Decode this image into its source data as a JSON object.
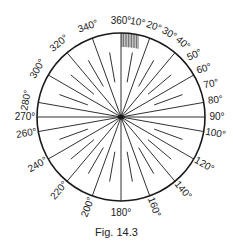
{
  "figure": {
    "caption": "Fig. 14.3",
    "center": [
      121,
      117
    ],
    "radius": 84,
    "stroke_color": "#1a1a1a",
    "hatch_color": "#555555",
    "hatched_sector": {
      "from_deg": 0,
      "to_deg": 12
    },
    "long_lines_deg": [
      0,
      20,
      40,
      60,
      80,
      90,
      100,
      120,
      140,
      160,
      180,
      200,
      220,
      240,
      260,
      270,
      280,
      300,
      320,
      340
    ],
    "short_lines_deg": [
      10,
      30,
      50,
      70,
      110,
      130,
      150,
      170,
      190,
      210,
      230,
      250,
      290,
      310,
      330,
      350
    ],
    "labels": [
      {
        "deg": 0,
        "text": "360°"
      },
      {
        "deg": 10,
        "text": "10°"
      },
      {
        "deg": 20,
        "text": "20°"
      },
      {
        "deg": 30,
        "text": "30°"
      },
      {
        "deg": 40,
        "text": "40°"
      },
      {
        "deg": 50,
        "text": "50°"
      },
      {
        "deg": 60,
        "text": "60°"
      },
      {
        "deg": 70,
        "text": "70°"
      },
      {
        "deg": 80,
        "text": "80°"
      },
      {
        "deg": 90,
        "text": "90°"
      },
      {
        "deg": 100,
        "text": "100°"
      },
      {
        "deg": 120,
        "text": "120°"
      },
      {
        "deg": 140,
        "text": "140°"
      },
      {
        "deg": 160,
        "text": "160°"
      },
      {
        "deg": 180,
        "text": "180°"
      },
      {
        "deg": 200,
        "text": "200°"
      },
      {
        "deg": 220,
        "text": "220°"
      },
      {
        "deg": 240,
        "text": "240°"
      },
      {
        "deg": 260,
        "text": "260°"
      },
      {
        "deg": 270,
        "text": "270°"
      },
      {
        "deg": 280,
        "text": "280°"
      },
      {
        "deg": 300,
        "text": "300°"
      },
      {
        "deg": 320,
        "text": "320°"
      },
      {
        "deg": 340,
        "text": "340°"
      }
    ]
  }
}
